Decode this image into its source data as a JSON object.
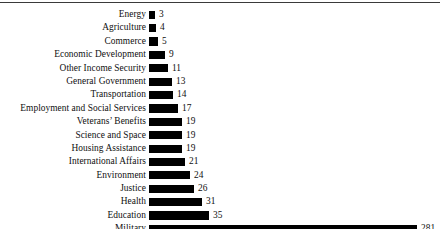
{
  "chart_data": {
    "type": "bar",
    "orientation": "horizontal",
    "title": "",
    "subtitle": "",
    "xlabel": "",
    "ylabel": "",
    "grid": false,
    "legend": false,
    "axis_visible": false,
    "value_labels": true,
    "xlim": [
      0,
      281
    ],
    "bar_color": "#000000",
    "background_color": "#ffffff",
    "text_color": "#101010",
    "rule_color": "#3a3a3a",
    "note": "Military bar is drawn on a broken/compressed scale; all other bars share a common linear scale.",
    "categories": [
      "Energy",
      "Agriculture",
      "Commerce",
      "Economic Development",
      "Other Income Security",
      "General Government",
      "Transportation",
      "Employment and Social Services",
      "Veterans’ Benefits",
      "Science and Space",
      "Housing Assistance",
      "International Affairs",
      "Environment",
      "Justice",
      "Health",
      "Education",
      "Military"
    ],
    "values": [
      3,
      4,
      5,
      9,
      11,
      13,
      14,
      17,
      19,
      19,
      19,
      21,
      24,
      26,
      31,
      35,
      281
    ]
  },
  "rows": [
    {
      "label": "Energy",
      "value": "3",
      "bar_px": 6,
      "value_x": 159
    },
    {
      "label": "Agriculture",
      "value": "4",
      "bar_px": 7,
      "value_x": 160
    },
    {
      "label": "Commerce",
      "value": "5",
      "bar_px": 9,
      "value_x": 162
    },
    {
      "label": "Economic Development",
      "value": "9",
      "bar_px": 16,
      "value_x": 169
    },
    {
      "label": "Other Income Security",
      "value": "11",
      "bar_px": 19,
      "value_x": 172
    },
    {
      "label": "General Government",
      "value": "13",
      "bar_px": 23,
      "value_x": 176
    },
    {
      "label": "Transportation",
      "value": "14",
      "bar_px": 24,
      "value_x": 177
    },
    {
      "label": "Employment and Social Services",
      "value": "17",
      "bar_px": 29,
      "value_x": 182
    },
    {
      "label": "Veterans’ Benefits",
      "value": "19",
      "bar_px": 33,
      "value_x": 186
    },
    {
      "label": "Science and Space",
      "value": "19",
      "bar_px": 33,
      "value_x": 186
    },
    {
      "label": "Housing Assistance",
      "value": "19",
      "bar_px": 33,
      "value_x": 186
    },
    {
      "label": "International Affairs",
      "value": "21",
      "bar_px": 36,
      "value_x": 189
    },
    {
      "label": "Environment",
      "value": "24",
      "bar_px": 41,
      "value_x": 194
    },
    {
      "label": "Justice",
      "value": "26",
      "bar_px": 45,
      "value_x": 198
    },
    {
      "label": "Health",
      "value": "31",
      "bar_px": 53,
      "value_x": 206
    },
    {
      "label": "Education",
      "value": "35",
      "bar_px": 60,
      "value_x": 213
    },
    {
      "label": "Military",
      "value": "281",
      "bar_px": 268,
      "value_x": 421
    }
  ]
}
